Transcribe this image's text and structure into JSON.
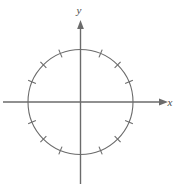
{
  "figure": {
    "background_color": "#ffffff",
    "stroke_color": "#6b6b6b",
    "label_color": "#4a4a4a",
    "axes": {
      "x_label": "x",
      "y_label": "y",
      "x_axis_name": "horizontal-axis",
      "y_axis_name": "vertical-axis",
      "x_arrow_direction": "right",
      "y_arrow_direction": "up",
      "origin": {
        "x": 80.5,
        "y": 102
      },
      "x_extent": [
        3,
        168
      ],
      "y_extent": [
        20,
        184
      ]
    },
    "circle": {
      "center_x": 80.5,
      "center_y": 102,
      "radius": 52.5
    }
  },
  "chart_data": {
    "type": "scatter",
    "xlabel": "x",
    "ylabel": "y",
    "grid": false,
    "legend": null,
    "xlim": [
      -1.55,
      1.65
    ],
    "ylim": [
      -1.58,
      1.62
    ],
    "shapes": [
      {
        "kind": "circle",
        "cx": 0,
        "cy": 0,
        "r": 1
      }
    ],
    "tick_angles_deg": [
      22.5,
      45,
      67.5,
      112.5,
      135,
      157.5,
      202.5,
      225,
      247.5,
      292.5,
      315,
      337.5
    ],
    "tick_count": 12,
    "tick_spacing_deg": 22.5,
    "tick_inner_radius": 0.92,
    "tick_outer_radius": 1.08,
    "ticks_at_axes": false,
    "annotations": []
  }
}
